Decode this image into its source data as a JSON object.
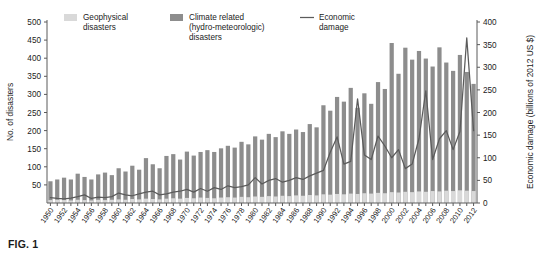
{
  "caption": "FIG. 1",
  "legend": {
    "items": [
      {
        "label_line1": "Geophysical",
        "label_line2": "disasters",
        "label_line3": "",
        "type": "swatch",
        "color": "#d9d9d9"
      },
      {
        "label_line1": "Climate related",
        "label_line2": "(hydro-meteorologic)",
        "label_line3": "disasters",
        "type": "swatch",
        "color": "#8d8d8d"
      },
      {
        "label_line1": "Economic",
        "label_line2": "damage",
        "label_line3": "",
        "type": "line",
        "color": "#5b5b5b"
      }
    ]
  },
  "chart_data": {
    "type": "bar",
    "title": "",
    "subtitle": "",
    "xlabel": "",
    "ylabel": "No. of disasters",
    "y2label": "Economic damage (billions of 2012 US $)",
    "ylim": [
      0,
      500
    ],
    "y_axis_start_label": 50,
    "yticks": [
      50,
      100,
      150,
      200,
      250,
      300,
      350,
      400,
      450,
      500
    ],
    "y2lim": [
      0,
      400
    ],
    "y2ticks": [
      0,
      50,
      100,
      150,
      200,
      250,
      300,
      350,
      400
    ],
    "grid": false,
    "legend_position": "top",
    "stacked": true,
    "x": [
      1950,
      1951,
      1952,
      1953,
      1954,
      1955,
      1956,
      1957,
      1958,
      1959,
      1960,
      1961,
      1962,
      1963,
      1964,
      1965,
      1966,
      1967,
      1968,
      1969,
      1970,
      1971,
      1972,
      1973,
      1974,
      1975,
      1976,
      1977,
      1978,
      1979,
      1980,
      1981,
      1982,
      1983,
      1984,
      1985,
      1986,
      1987,
      1988,
      1989,
      1990,
      1991,
      1992,
      1993,
      1994,
      1995,
      1996,
      1997,
      1998,
      1999,
      2000,
      2001,
      2002,
      2003,
      2004,
      2005,
      2006,
      2007,
      2008,
      2009,
      2010,
      2011,
      2012
    ],
    "xtick_labels": [
      1950,
      1952,
      1954,
      1956,
      1958,
      1960,
      1962,
      1964,
      1966,
      1968,
      1970,
      1972,
      1974,
      1976,
      1978,
      1980,
      1982,
      1984,
      1986,
      1988,
      1990,
      1992,
      1994,
      1996,
      1998,
      2000,
      2002,
      2004,
      2006,
      2008,
      2010,
      2012
    ],
    "series": [
      {
        "name": "Geophysical disasters",
        "color": "#d9d9d9",
        "values": [
          8,
          9,
          8,
          7,
          9,
          8,
          7,
          9,
          8,
          9,
          10,
          9,
          11,
          10,
          12,
          11,
          10,
          12,
          13,
          12,
          14,
          13,
          15,
          14,
          13,
          15,
          16,
          15,
          17,
          16,
          18,
          17,
          19,
          18,
          20,
          19,
          21,
          20,
          22,
          21,
          24,
          23,
          25,
          24,
          26,
          25,
          27,
          26,
          28,
          27,
          30,
          29,
          31,
          30,
          32,
          31,
          33,
          32,
          34,
          33,
          35,
          34,
          33
        ]
      },
      {
        "name": "Climate related (hydro-meteorologic) disasters",
        "color": "#8d8d8d",
        "values": [
          52,
          56,
          62,
          58,
          72,
          64,
          58,
          70,
          76,
          68,
          86,
          78,
          92,
          82,
          112,
          96,
          86,
          118,
          122,
          108,
          128,
          118,
          126,
          132,
          128,
          136,
          142,
          138,
          152,
          146,
          166,
          158,
          172,
          164,
          178,
          172,
          182,
          176,
          196,
          188,
          246,
          232,
          268,
          256,
          292,
          238,
          276,
          248,
          306,
          288,
          412,
          328,
          398,
          366,
          388,
          368,
          344,
          398,
          354,
          332,
          374,
          328,
          296
        ]
      }
    ],
    "line_series": {
      "name": "Economic damage",
      "color": "#5b5b5b",
      "axis": "right",
      "values": [
        12,
        10,
        9,
        11,
        14,
        18,
        10,
        13,
        12,
        14,
        22,
        18,
        16,
        20,
        24,
        26,
        18,
        20,
        24,
        26,
        30,
        24,
        32,
        26,
        34,
        30,
        38,
        34,
        36,
        40,
        56,
        42,
        50,
        54,
        46,
        50,
        56,
        52,
        60,
        66,
        72,
        112,
        146,
        86,
        92,
        230,
        106,
        96,
        148,
        126,
        100,
        118,
        76,
        86,
        142,
        248,
        96,
        142,
        160,
        118,
        158,
        365,
        160
      ]
    }
  }
}
